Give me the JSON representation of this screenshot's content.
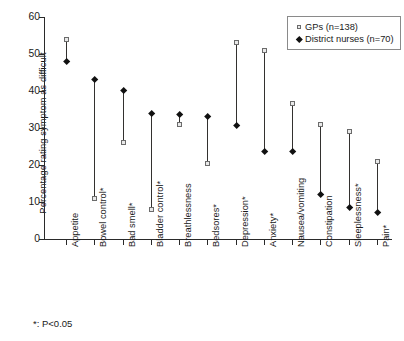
{
  "chart_data": {
    "type": "scatter",
    "title": "",
    "subtitle": "",
    "xlabel": "",
    "ylabel": "Percentage rating symptom as difficult",
    "ylim": [
      0,
      60
    ],
    "yticks": [
      0,
      10,
      20,
      30,
      40,
      50,
      60
    ],
    "ytick_labels": [
      "0",
      "10",
      "20",
      "30",
      "40",
      "50",
      "60"
    ],
    "grid": false,
    "legend_position": "top-right",
    "categories": [
      "Appetite",
      "Bowel control*",
      "Bad smell*",
      "Bladder control*",
      "Breathlessness",
      "Bedsores*",
      "Depression*",
      "Anxiety*",
      "Nausea/vomiting",
      "Constipation",
      "Sleeplessness*",
      "Pain*"
    ],
    "series": [
      {
        "name": "GPs (n=138)",
        "marker": "open-square",
        "values": [
          54,
          11,
          26,
          8,
          31,
          20.5,
          53,
          51,
          36.5,
          31,
          29,
          21
        ]
      },
      {
        "name": "District nurses (n=70)",
        "marker": "filled-diamond",
        "values": [
          48,
          43,
          40,
          34,
          33.5,
          33,
          30.5,
          23.5,
          23.5,
          12,
          8.5,
          7
        ]
      }
    ],
    "annotations": [
      "*: P<0.05"
    ]
  },
  "legend": {
    "entries": [
      {
        "label": "GPs (n=138)"
      },
      {
        "label": "District nurses (n=70)"
      }
    ]
  },
  "footnote": {
    "text": "*: P<0.05"
  },
  "colors": {
    "axis": "#2a2a2a",
    "gp_marker_edge": "#6b6b6b",
    "gp_marker_fill": "#e9e9e9",
    "nurse_marker": "#111111",
    "range_line": "#33312f",
    "background": "#ffffff"
  }
}
